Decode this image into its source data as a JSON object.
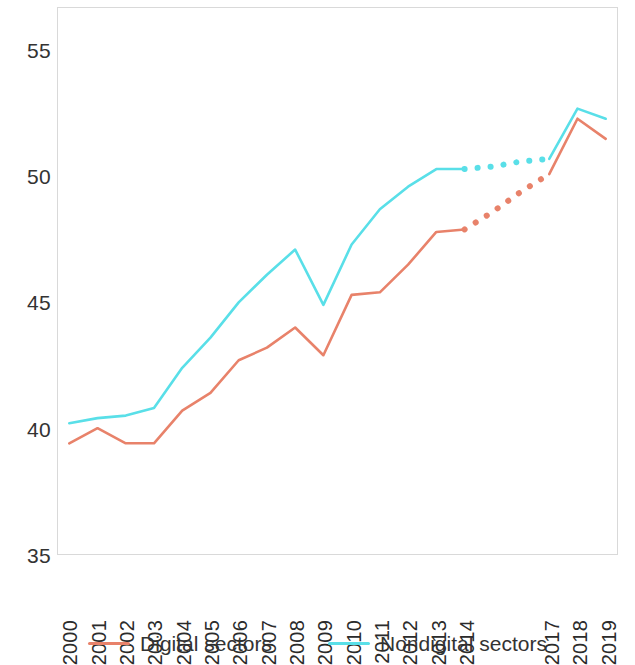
{
  "chart_data": {
    "type": "line",
    "title": "",
    "subtitle": "",
    "xlabel": "",
    "ylabel": "",
    "x": [
      2000,
      2001,
      2002,
      2003,
      2004,
      2005,
      2006,
      2007,
      2008,
      2009,
      2010,
      2011,
      2012,
      2013,
      2014,
      2015,
      2016,
      2017,
      2018,
      2019
    ],
    "xtick_labels": [
      "2000",
      "2001",
      "2002",
      "2003",
      "2004",
      "2005",
      "2006",
      "2007",
      "2008",
      "2009",
      "2010",
      "2011",
      "2012",
      "2013",
      "2014",
      "",
      "",
      "2017",
      "2018",
      "2019"
    ],
    "ytick_labels": [
      "35",
      "40",
      "45",
      "50",
      "55"
    ],
    "yticks": [
      35,
      40,
      45,
      50,
      55
    ],
    "ylim": [
      35,
      56.7
    ],
    "xlim": [
      1999.6,
      2019.4
    ],
    "grid": false,
    "legend_position": "bottom",
    "series": [
      {
        "name": "Digital sectors",
        "color": "#e8826a",
        "linestyle": "solid",
        "dashed_range": [
          2014,
          2017
        ],
        "values": [
          39.4,
          40.0,
          39.4,
          39.4,
          40.7,
          41.4,
          42.7,
          43.2,
          44.0,
          42.9,
          45.3,
          45.4,
          46.5,
          47.8,
          47.9,
          48.6,
          49.4,
          50.1,
          52.3,
          51.5
        ]
      },
      {
        "name": "Nondigital sectors",
        "color": "#59dfe8",
        "linestyle": "solid",
        "dashed_range": [
          2014,
          2017
        ],
        "values": [
          40.2,
          40.4,
          40.5,
          40.8,
          42.4,
          43.6,
          45.0,
          46.1,
          47.1,
          44.9,
          47.3,
          48.7,
          49.6,
          50.3,
          50.3,
          50.4,
          50.6,
          50.7,
          52.7,
          52.3
        ]
      }
    ]
  },
  "legend": {
    "entries": [
      {
        "label": "Digital sectors",
        "color": "#e8826a"
      },
      {
        "label": "Nondigital sectors",
        "color": "#59dfe8"
      }
    ]
  }
}
